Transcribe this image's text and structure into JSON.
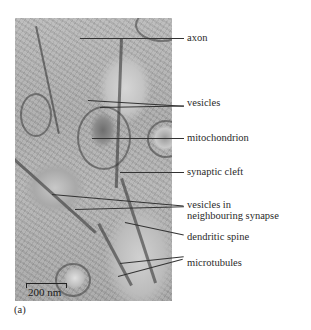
{
  "figure": {
    "panel_label": "(a)",
    "scale_bar": "200 nm",
    "labels": [
      {
        "id": "axon",
        "text": "axon"
      },
      {
        "id": "vesicles",
        "text": "vesicles"
      },
      {
        "id": "mitochondrion",
        "text": "mitochondrion"
      },
      {
        "id": "synaptic-cleft",
        "text": "synaptic cleft"
      },
      {
        "id": "vesicles-neighbouring-1",
        "text": "vesicles in"
      },
      {
        "id": "vesicles-neighbouring-2",
        "text": "neighbouring synapse"
      },
      {
        "id": "dendritic-spine",
        "text": "dendritic spine"
      },
      {
        "id": "microtubules",
        "text": "microtubules"
      }
    ]
  }
}
